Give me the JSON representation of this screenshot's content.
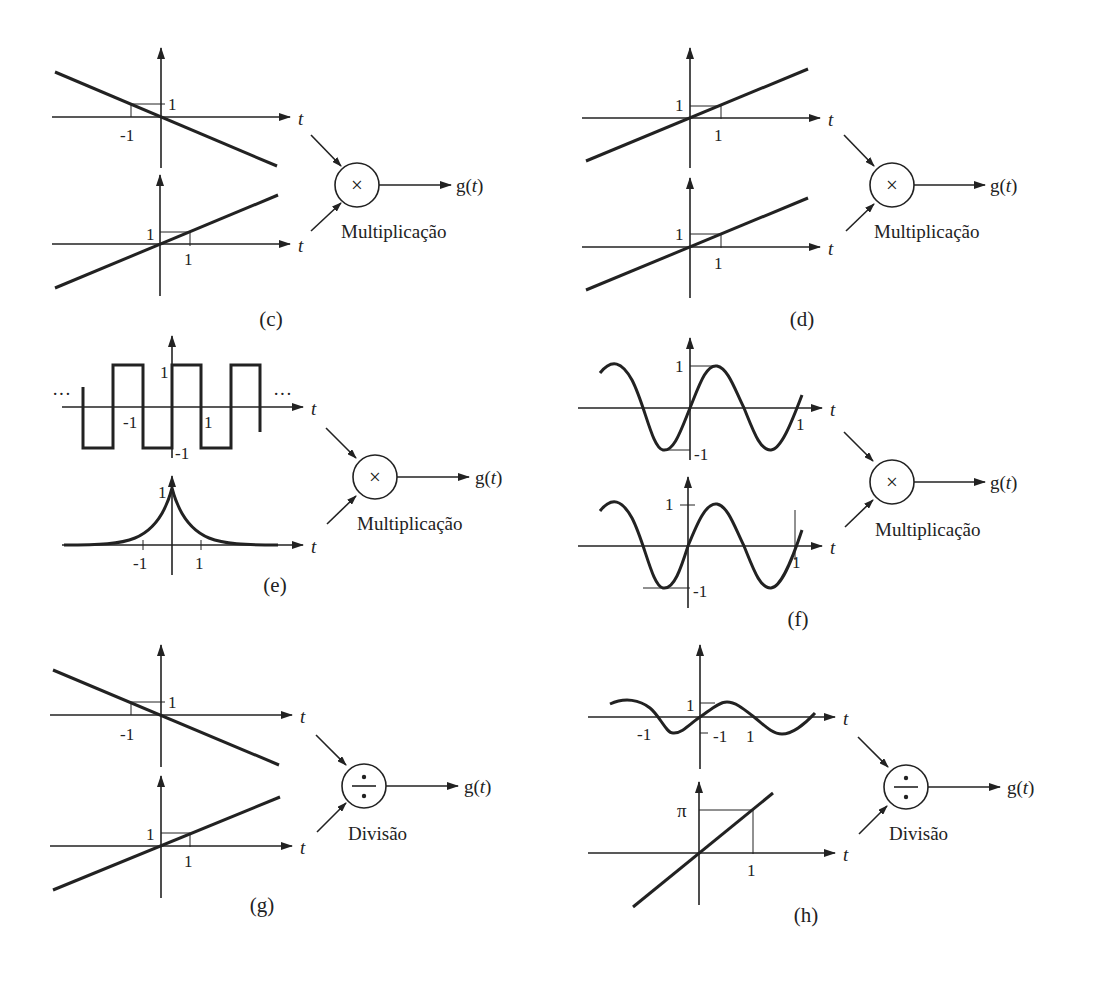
{
  "figure": {
    "axis_label": "t",
    "output_label": "g(t)",
    "panels": [
      {
        "id": "c",
        "caption": "(c)",
        "operation": "Multiplicação",
        "operator_symbol": "×",
        "inputs": [
          {
            "type": "line",
            "expression": "-t",
            "ticks": {
              "x": [
                "-1"
              ],
              "y": [
                "1"
              ]
            }
          },
          {
            "type": "line",
            "expression": "t",
            "ticks": {
              "x": [
                "1"
              ],
              "y": [
                "1"
              ]
            }
          }
        ]
      },
      {
        "id": "d",
        "caption": "(d)",
        "operation": "Multiplicação",
        "operator_symbol": "×",
        "inputs": [
          {
            "type": "line",
            "expression": "t",
            "ticks": {
              "x": [
                "1"
              ],
              "y": [
                "1"
              ]
            }
          },
          {
            "type": "line",
            "expression": "t",
            "ticks": {
              "x": [
                "1"
              ],
              "y": [
                "1"
              ]
            }
          }
        ]
      },
      {
        "id": "e",
        "caption": "(e)",
        "operation": "Multiplicação",
        "operator_symbol": "×",
        "inputs": [
          {
            "type": "square_wave",
            "amplitude": 1,
            "ticks": {
              "x": [
                "-1",
                "1"
              ],
              "y": [
                "1",
                "-1"
              ]
            },
            "continuation": "..."
          },
          {
            "type": "two_sided_exponential",
            "peak": 1,
            "ticks": {
              "x": [
                "-1",
                "1"
              ],
              "y": [
                "1"
              ]
            }
          }
        ]
      },
      {
        "id": "f",
        "caption": "(f)",
        "operation": "Multiplicação",
        "operator_symbol": "×",
        "inputs": [
          {
            "type": "sine",
            "amplitude": 1,
            "ticks": {
              "x": [
                "1"
              ],
              "y": [
                "1",
                "-1"
              ]
            }
          },
          {
            "type": "sine",
            "amplitude": 1,
            "ticks": {
              "x": [
                "1"
              ],
              "y": [
                "1",
                "-1"
              ]
            }
          }
        ]
      },
      {
        "id": "g",
        "caption": "(g)",
        "operation": "Divisão",
        "operator_symbol": "÷",
        "inputs": [
          {
            "type": "line",
            "expression": "-t",
            "ticks": {
              "x": [
                "-1"
              ],
              "y": [
                "1"
              ]
            }
          },
          {
            "type": "line",
            "expression": "t",
            "ticks": {
              "x": [
                "1"
              ],
              "y": [
                "1"
              ]
            }
          }
        ]
      },
      {
        "id": "h",
        "caption": "(h)",
        "operation": "Divisão",
        "operator_symbol": "÷",
        "inputs": [
          {
            "type": "sine",
            "amplitude": 1,
            "ticks": {
              "x": [
                "-1",
                "1"
              ],
              "y": [
                "1",
                "-1"
              ]
            }
          },
          {
            "type": "line",
            "expression": "πt",
            "ticks": {
              "x": [
                "1"
              ],
              "y": [
                "π"
              ]
            }
          }
        ]
      }
    ]
  },
  "labels": {
    "t": "t",
    "g": "g(t)",
    "one": "1",
    "neg_one": "-1",
    "pi": "π",
    "dots": "···",
    "mult": "Multiplicação",
    "div": "Divisão",
    "times": "×",
    "divide": "÷",
    "cap_c": "(c)",
    "cap_d": "(d)",
    "cap_e": "(e)",
    "cap_f": "(f)",
    "cap_g": "(g)",
    "cap_h": "(h)"
  }
}
